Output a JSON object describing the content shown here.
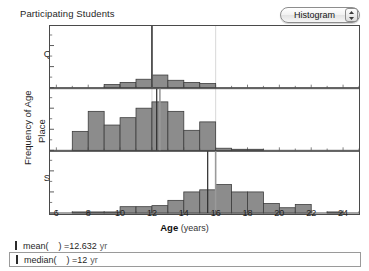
{
  "header": {
    "title": "Participating Students",
    "dropdown_value": "Histogram",
    "stepper_icon": "stepper-up-down-icon"
  },
  "axes": {
    "y_title_top": "Frequency of Age",
    "y_title_bottom": "Place",
    "x_title_bold": "Age",
    "x_title_units": "(years)",
    "y_ticks": [
      "0",
      "20",
      "40"
    ],
    "x_ticks": [
      "6",
      "8",
      "10",
      "12",
      "14",
      "16",
      "18",
      "20",
      "22",
      "24"
    ],
    "x_min": 5.6,
    "x_max": 25.0,
    "y_min": 0,
    "y_max": 50
  },
  "panels": [
    {
      "name": "Queensland"
    },
    {
      "name": "UK"
    },
    {
      "name": "South Africa"
    }
  ],
  "stats": {
    "mean_label": "mean(",
    "mean_close": ") = ",
    "mean_value": "12.632",
    "mean_unit": "yr",
    "median_label": "median(",
    "median_close": ") = ",
    "median_value": "12",
    "median_unit": "yr"
  },
  "colors": {
    "bar_fill": "#8c8c8c",
    "bar_stroke": "#3d3d3d",
    "axis": "#4a4a4a",
    "mean_line": "#2b2b2b",
    "median_line": "#9a9a9a",
    "text": "#1f1f1f"
  },
  "chart_data": {
    "type": "bar",
    "title": "Participating Students",
    "xlabel": "Age (years)",
    "ylabel": "Frequency of Age",
    "grid": false,
    "legend": "none",
    "xlim": [
      5.6,
      25.0
    ],
    "ylim": [
      0,
      50
    ],
    "facet_variable": "Place",
    "bin_width": 1,
    "series": [
      {
        "name": "Queensland",
        "mean_line": 12.0,
        "median_line": 12.0,
        "bins": [
          9,
          10,
          11,
          12,
          13,
          14,
          15
        ],
        "values": [
          3,
          5,
          8,
          12,
          7,
          5,
          4
        ]
      },
      {
        "name": "UK",
        "mean_line": 12.3,
        "median_line": 12.5,
        "bins": [
          7,
          8,
          9,
          10,
          11,
          12,
          13,
          14,
          15,
          16,
          17,
          18
        ],
        "values": [
          18,
          37,
          24,
          31,
          40,
          46,
          37,
          19,
          27,
          2,
          1,
          1
        ]
      },
      {
        "name": "South Africa",
        "mean_line": 15.5,
        "median_line": 16.0,
        "bins": [
          7,
          8,
          9,
          10,
          11,
          12,
          13,
          14,
          15,
          16,
          17,
          18,
          19,
          20,
          21,
          23
        ],
        "values": [
          1,
          1,
          1,
          6,
          6,
          7,
          12,
          20,
          22,
          27,
          20,
          20,
          9,
          5,
          8,
          1
        ]
      }
    ]
  }
}
